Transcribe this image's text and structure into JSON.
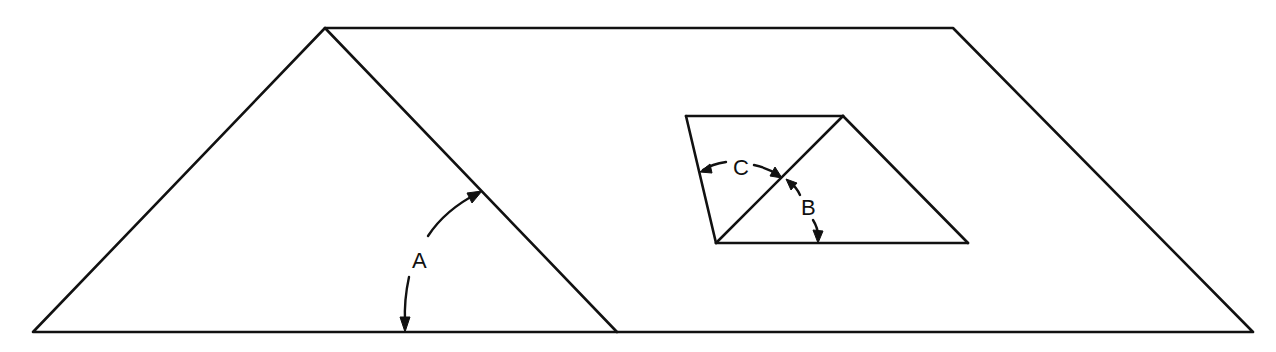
{
  "diagram": {
    "background": "#ffffff",
    "stroke_color": "#111111",
    "outer_trapezoid": {
      "points": "33,332 325,28 953,28 1253,332"
    },
    "interior_diagonal": {
      "x1": 325,
      "y1": 28,
      "x2": 617,
      "y2": 332
    },
    "inner_figure": {
      "top_edge": {
        "x1": 686,
        "y1": 116,
        "x2": 843,
        "y2": 116
      },
      "bottom_edge": {
        "x1": 716,
        "y1": 243,
        "x2": 968,
        "y2": 243
      },
      "left_edge": {
        "x1": 686,
        "y1": 116,
        "x2": 716,
        "y2": 243
      },
      "diagonal": {
        "x1": 716,
        "y1": 243,
        "x2": 843,
        "y2": 116
      },
      "right_edge": {
        "x1": 843,
        "y1": 116,
        "x2": 968,
        "y2": 243
      }
    },
    "angles": [
      {
        "id": "A",
        "label": "A",
        "label_x": 412,
        "label_y": 268
      },
      {
        "id": "B",
        "label": "B",
        "label_x": 801,
        "label_y": 215
      },
      {
        "id": "C",
        "label": "C",
        "label_x": 733,
        "label_y": 175
      }
    ]
  }
}
